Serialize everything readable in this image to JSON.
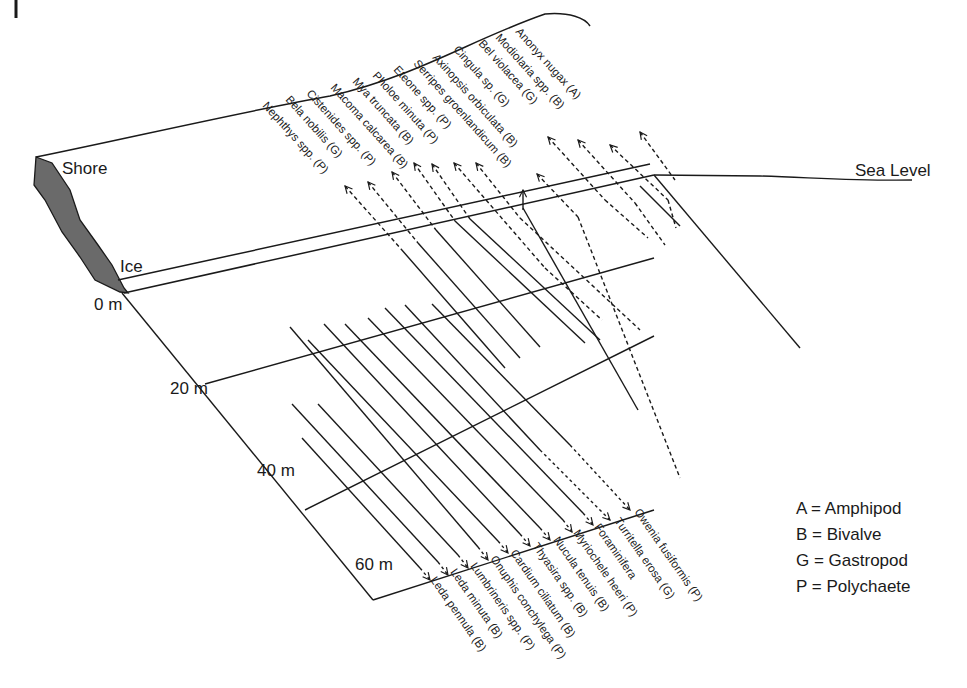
{
  "diagram": {
    "labels": {
      "shore": "Shore",
      "ice": "Ice",
      "sea_level": "Sea Level"
    },
    "depths": [
      "0 m",
      "20 m",
      "40 m",
      "60 m"
    ],
    "legend": [
      {
        "code": "A",
        "text": "A = Amphipod"
      },
      {
        "code": "B",
        "text": "B = Bivalve"
      },
      {
        "code": "G",
        "text": "G = Gastropod"
      },
      {
        "code": "P",
        "text": "P = Polychaete"
      }
    ],
    "shallow_species": [
      "Nephthys spp. (P)",
      "Bela nobilis (G)",
      "Cistenides spp. (P)",
      "Macoma calcarea (B)",
      "Mya truncata (B)",
      "Pholoe minuta (P)",
      "Eteone spp. (P)",
      "Serripes groenlandicum (B)",
      "Axinopsis orbiculata (B)",
      "Cingula sp. (G)",
      "Bel violacea (G)",
      "Modiolaria spp. (B)",
      "Anonyx nugax (A)"
    ],
    "deep_species": [
      "Leda pennula (B)",
      "Leda minuta (B)",
      "Lumbrineris spp. (P)",
      "Onuphis conchylega (P)",
      "Cardium ciliatum (B)",
      "Thyasira spp. (B)",
      "Nucula tenuis (B)",
      "Myriochele heeri (P)",
      "Foraminifera",
      "Turritella erosa (G)",
      "Owenia fusiformis (P)"
    ]
  }
}
